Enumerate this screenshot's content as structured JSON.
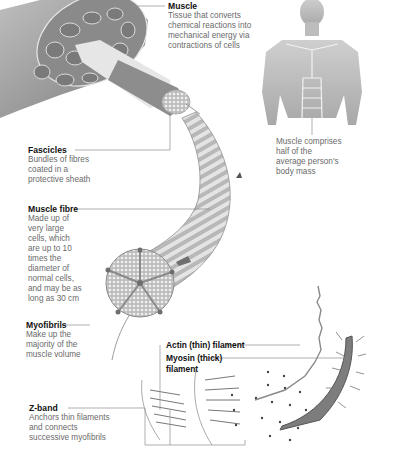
{
  "diagram": {
    "colors": {
      "ink": "#111111",
      "desc": "#6a6a6a",
      "leader": "#8c8c8c",
      "tissue": "#9a9a9a",
      "tissue_light": "#d4d4d4"
    },
    "labels": {
      "muscle": {
        "title": "Muscle",
        "desc": "Tissue that converts\nchemical reactions into\nmechanical energy via\ncontractions of cells"
      },
      "body_note": {
        "desc": "Muscle comprises\nhalf of the\naverage person's\nbody mass"
      },
      "fascicles": {
        "title": "Fascicles",
        "desc": "Bundles of fibres\ncoated in a\nprotective sheath"
      },
      "muscle_fibre": {
        "title": "Muscle fibre",
        "desc": "Made up of\nvery large\ncells, which\nare up to 10\ntimes the\ndiameter of\nnormal cells,\nand may be as\nlong as 30 cm"
      },
      "myofibrils": {
        "title": "Myofibrils",
        "desc": "Make up the\nmajority of the\nmuscle volume"
      },
      "z_band": {
        "title": "Z-band",
        "desc": "Anchors thin filaments\nand connects\nsuccessive myofibrils"
      },
      "actin": {
        "title": "Actin (thin) filament"
      },
      "myosin": {
        "title": "Myosin (thick)\nfilament"
      }
    }
  }
}
